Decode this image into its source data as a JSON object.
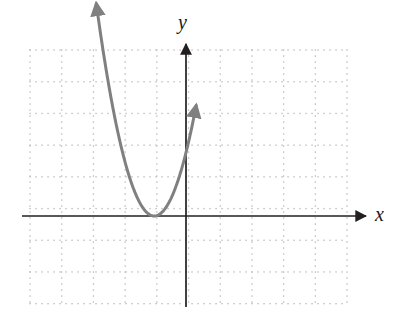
{
  "figure": {
    "width": 402,
    "height": 326,
    "background": "#ffffff"
  },
  "axes": {
    "x_label": "x",
    "y_label": "y",
    "axis_color": "#231f20",
    "x_axis_pixel_y": 216,
    "y_axis_pixel_x": 186,
    "x_axis_start_px": 22,
    "x_axis_arrow_tip_px": 368,
    "y_axis_arrow_tip_px": 42,
    "y_axis_end_px": 307,
    "arrowheads": [
      "x-positive",
      "y-positive"
    ]
  },
  "grid": {
    "style": "dotted",
    "dot_color": "#c9c9c9",
    "major_line_color": "#b5b5b5",
    "dot_spacing_px": 6,
    "major_spacing_px": 31.7,
    "left_px": 30,
    "right_px": 347,
    "top_px": 50,
    "bottom_px": 307,
    "columns": 10,
    "rows": 8
  },
  "chart_data": {
    "type": "line",
    "title": "",
    "subtitle": "",
    "xlabel": "x",
    "ylabel": "y",
    "grid": true,
    "legend_position": "none",
    "xlim": [
      -4.9,
      5.1
    ],
    "ylim": [
      -2.9,
      5.2
    ],
    "unit_px": 31.7,
    "series": [
      {
        "name": "parabola",
        "equation": "y = 2(x + 1)^2",
        "color": "#808080",
        "stroke_width": 3,
        "vertex": [
          -1,
          0
        ],
        "leading_coefficient": 2,
        "opens": "up",
        "x_intercepts": [
          -1
        ],
        "y_intercept": 2,
        "arrow_ends": [
          "left",
          "right"
        ],
        "x": [
          -2.83,
          -2.6,
          -2.4,
          -2.2,
          -2.0,
          -1.8,
          -1.6,
          -1.4,
          -1.2,
          -1.0,
          -0.8,
          -0.6,
          -0.4,
          -0.2,
          0.0,
          0.2,
          0.35
        ],
        "y": [
          6.7,
          5.12,
          3.92,
          2.88,
          2.0,
          1.28,
          0.72,
          0.32,
          0.08,
          0.0,
          0.08,
          0.32,
          0.72,
          1.28,
          2.0,
          2.88,
          3.65
        ],
        "arrow_left_point": [
          -2.83,
          4.77
        ],
        "arrow_right_point": [
          0.32,
          4.86
        ]
      }
    ],
    "annotations": []
  }
}
